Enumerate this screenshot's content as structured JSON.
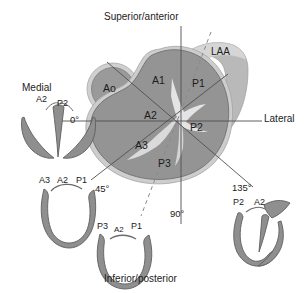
{
  "diagram": {
    "title_visible": false,
    "type": "mitral-valve-segment-anatomy",
    "colors": {
      "annulus_fill": "#949494",
      "annulus_border": "#c9c9c9",
      "annulus_outline": "#6f6f6f",
      "aorta_fill": "#9a9a9a",
      "aorta_ring": "#cccccc",
      "laa_fill": "#b9b9b9",
      "laa_light": "#d4d4d4",
      "leaflet_white": "#efefef",
      "line": "#555555",
      "dashed": "#8a8a8a",
      "valve_fill": "#8f8f8f",
      "valve_stroke": "#5f5f5f",
      "text": "#1c1c1c",
      "background": "#ffffff"
    }
  },
  "orientation_labels": {
    "top": "Superior/anterior",
    "bottom": "Inferior/posterior",
    "left": "Medial",
    "right": "Lateral"
  },
  "annulus_segments": [
    {
      "id": "A1",
      "label": "A1"
    },
    {
      "id": "A2",
      "label": "A2"
    },
    {
      "id": "A3",
      "label": "A3"
    },
    {
      "id": "P1",
      "label": "P1"
    },
    {
      "id": "P2",
      "label": "P2"
    },
    {
      "id": "P3",
      "label": "P3"
    }
  ],
  "structures": {
    "aorta": "Ao",
    "left_atrial_appendage": "LAA"
  },
  "imaging_planes": [
    {
      "angle_label": "0°",
      "value": 0
    },
    {
      "angle_label": "45°",
      "value": 45
    },
    {
      "angle_label": "90°",
      "value": 90
    },
    {
      "angle_label": "135°",
      "value": 135
    }
  ],
  "valve_views": [
    {
      "id": "view-0",
      "angle_label": "0°",
      "position": "left",
      "segment_labels": [
        "A2",
        "P2"
      ]
    },
    {
      "id": "view-45",
      "angle_label": "45°",
      "position": "lower-left",
      "segment_labels": [
        "A3",
        "A2",
        "P1"
      ]
    },
    {
      "id": "view-90",
      "angle_label": "90°",
      "position": "bottom",
      "segment_labels": [
        "P3",
        "A2",
        "P1"
      ]
    },
    {
      "id": "view-135",
      "angle_label": "135°",
      "position": "lower-right",
      "segment_labels": [
        "P2",
        "A2"
      ]
    }
  ]
}
